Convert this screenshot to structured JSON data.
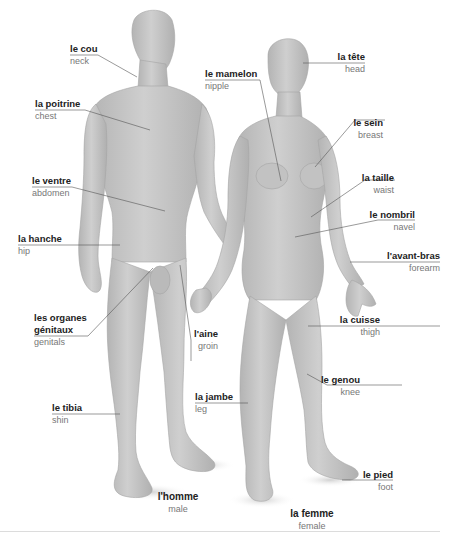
{
  "diagram": {
    "type": "labeled-anatomy-illustration",
    "figures": {
      "male": {
        "fr": "l'homme",
        "en": "male"
      },
      "female": {
        "fr": "la femme",
        "en": "female"
      }
    },
    "labels_left": [
      {
        "id": "neck",
        "fr": "le cou",
        "en": "neck"
      },
      {
        "id": "chest",
        "fr": "la poitrine",
        "en": "chest"
      },
      {
        "id": "abdomen",
        "fr": "le ventre",
        "en": "abdomen"
      },
      {
        "id": "hip",
        "fr": "la hanche",
        "en": "hip"
      },
      {
        "id": "genitals",
        "fr": "les organes génitaux",
        "fr_line1": "les organes",
        "fr_line2": "génitaux",
        "en": "genitals"
      },
      {
        "id": "shin",
        "fr": "le tibia",
        "en": "shin"
      }
    ],
    "labels_middle": [
      {
        "id": "nipple",
        "fr": "le mamelon",
        "en": "nipple"
      },
      {
        "id": "groin",
        "fr": "l'aine",
        "en": "groin"
      },
      {
        "id": "leg",
        "fr": "la jambe",
        "en": "leg"
      }
    ],
    "labels_right": [
      {
        "id": "head",
        "fr": "la tête",
        "en": "head"
      },
      {
        "id": "breast",
        "fr": "le sein",
        "en": "breast"
      },
      {
        "id": "waist",
        "fr": "la taille",
        "en": "waist"
      },
      {
        "id": "navel",
        "fr": "le nombril",
        "en": "navel"
      },
      {
        "id": "forearm",
        "fr": "l'avant-bras",
        "en": "forearm"
      },
      {
        "id": "thigh",
        "fr": "la cuisse",
        "en": "thigh"
      },
      {
        "id": "knee",
        "fr": "le genou",
        "en": "knee"
      },
      {
        "id": "foot",
        "fr": "le pied",
        "en": "foot"
      }
    ],
    "colors": {
      "body": "#c8c8c8",
      "body_shade": "#a9a9a9",
      "leader": "#555555",
      "label_fr": "#222222",
      "label_en": "#777777",
      "rule": "#dcdcdc"
    }
  }
}
